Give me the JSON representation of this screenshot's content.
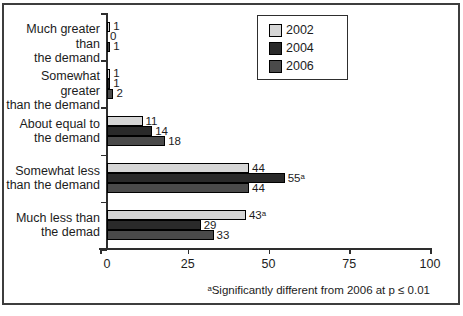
{
  "figure": {
    "background": "#ffffff",
    "frame_color": "#3d3d3d",
    "axis_color": "#2e2e2e",
    "text_color": "#1c1c1c"
  },
  "chart_data": {
    "type": "bar",
    "orientation": "horizontal",
    "title": "",
    "xlabel": "",
    "ylabel": "",
    "xlim": [
      0,
      100
    ],
    "x_ticks": [
      0,
      25,
      50,
      75,
      100
    ],
    "grid": false,
    "legend_position": "top-right",
    "categories": [
      "Much greater than the demand",
      "Somewhat greater than the demand",
      "About equal to the demand",
      "Somewhat less than the demand",
      "Much less than the demad"
    ],
    "category_lines": [
      [
        "Much greater than",
        "the demand"
      ],
      [
        "Somewhat greater",
        "than the demand"
      ],
      [
        "About equal to",
        "the demand"
      ],
      [
        "Somewhat less",
        "than the demand"
      ],
      [
        "Much less than",
        "the demad"
      ]
    ],
    "series": [
      {
        "name": "2002",
        "color": "#d6d6d6",
        "values": [
          1,
          1,
          11,
          44,
          43
        ],
        "value_labels": [
          "1",
          "1",
          "11",
          "44",
          "43ᵃ"
        ]
      },
      {
        "name": "2004",
        "color": "#2a2a2a",
        "values": [
          0,
          1,
          14,
          55,
          29
        ],
        "value_labels": [
          "0",
          "1",
          "14",
          "55ᵃ",
          "29"
        ]
      },
      {
        "name": "2006",
        "color": "#4a4a4a",
        "values": [
          1,
          2,
          18,
          44,
          33
        ],
        "value_labels": [
          "1",
          "2",
          "18",
          "44",
          "33"
        ]
      }
    ],
    "footnote": "ᵃSignificantly different from 2006 at p ≤ 0.01"
  }
}
